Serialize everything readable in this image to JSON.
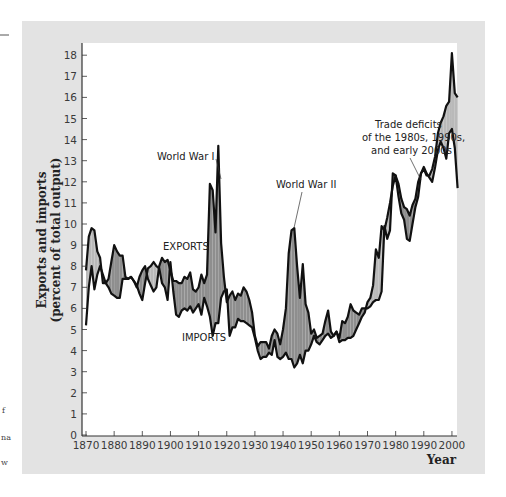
{
  "chart_data": {
    "type": "line",
    "title": "",
    "xlabel": "Year",
    "ylabel": "Exports and imports (percent of total output)",
    "ylabel_lines": [
      "Exports and imports",
      "(percent of total output)"
    ],
    "xlim": [
      1870,
      2002
    ],
    "ylim": [
      0,
      18.5
    ],
    "x_ticks": [
      1870,
      1880,
      1890,
      1900,
      1910,
      1920,
      1930,
      1940,
      1950,
      1960,
      1970,
      1980,
      1990,
      2000
    ],
    "y_ticks": [
      0,
      1,
      2,
      3,
      4,
      5,
      6,
      7,
      8,
      9,
      10,
      11,
      12,
      13,
      14,
      15,
      16,
      17,
      18
    ],
    "grid": false,
    "legend": "none (direct labels)",
    "fill_colors": {
      "exports_above": "#8e8e8e",
      "imports_above": "#b9b9b9"
    },
    "series": [
      {
        "name": "EXPORTS",
        "x": [
          1870,
          1871,
          1872,
          1873,
          1874,
          1875,
          1876,
          1877,
          1878,
          1879,
          1880,
          1881,
          1882,
          1883,
          1884,
          1885,
          1886,
          1887,
          1888,
          1889,
          1890,
          1891,
          1892,
          1893,
          1894,
          1895,
          1896,
          1897,
          1898,
          1899,
          1900,
          1901,
          1902,
          1903,
          1904,
          1905,
          1906,
          1907,
          1908,
          1909,
          1910,
          1911,
          1912,
          1913,
          1914,
          1915,
          1916,
          1917,
          1918,
          1919,
          1920,
          1921,
          1922,
          1923,
          1924,
          1925,
          1926,
          1927,
          1928,
          1929,
          1930,
          1931,
          1932,
          1933,
          1934,
          1935,
          1936,
          1937,
          1938,
          1939,
          1940,
          1941,
          1942,
          1943,
          1944,
          1945,
          1946,
          1947,
          1948,
          1949,
          1950,
          1951,
          1952,
          1953,
          1954,
          1955,
          1956,
          1957,
          1958,
          1959,
          1960,
          1961,
          1962,
          1963,
          1964,
          1965,
          1966,
          1967,
          1968,
          1969,
          1970,
          1971,
          1972,
          1973,
          1974,
          1975,
          1976,
          1977,
          1978,
          1979,
          1980,
          1981,
          1982,
          1983,
          1984,
          1985,
          1986,
          1987,
          1988,
          1989,
          1990,
          1991,
          1992,
          1993,
          1994,
          1995,
          1996,
          1997,
          1998,
          1999,
          2000,
          2001,
          2002
        ],
        "values": [
          5.2,
          7.0,
          8.0,
          6.9,
          7.6,
          8.0,
          7.6,
          7.2,
          7.4,
          8.2,
          9.0,
          8.7,
          8.5,
          8.5,
          7.5,
          7.4,
          7.5,
          7.3,
          7.0,
          7.5,
          7.8,
          8.0,
          7.4,
          7.1,
          6.8,
          7.0,
          8.0,
          8.4,
          8.2,
          8.3,
          7.8,
          7.3,
          7.3,
          7.2,
          7.2,
          7.5,
          7.4,
          7.7,
          6.9,
          6.8,
          7.0,
          7.6,
          7.2,
          7.6,
          11.9,
          11.6,
          9.6,
          13.7,
          9.1,
          7.5,
          6.3,
          6.6,
          6.8,
          6.4,
          6.7,
          6.6,
          7.0,
          6.8,
          6.4,
          5.8,
          4.7,
          4.2,
          4.4,
          4.4,
          4.4,
          4.1,
          4.7,
          5.0,
          4.8,
          4.3,
          5.0,
          6.0,
          8.6,
          9.7,
          9.8,
          8.0,
          6.5,
          8.1,
          6.2,
          5.8,
          4.8,
          5.0,
          4.6,
          4.7,
          4.8,
          5.4,
          5.9,
          4.9,
          4.7,
          4.9,
          4.6,
          5.4,
          5.3,
          5.6,
          6.2,
          5.9,
          5.8,
          5.7,
          6.0,
          6.0,
          6.0,
          6.1,
          6.3,
          6.4,
          6.4,
          6.8,
          9.9,
          9.3,
          9.7,
          12.4,
          12.3,
          11.9,
          11.2,
          10.8,
          10.7,
          10.4,
          10.9,
          11.2,
          12.0,
          12.4,
          12.7,
          12.4,
          12.2,
          12.0,
          12.7,
          13.5,
          13.9,
          13.6,
          13.1,
          14.3,
          14.5,
          13.6,
          11.7
        ]
      },
      {
        "name": "IMPORTS",
        "x": [
          1870,
          1871,
          1872,
          1873,
          1874,
          1875,
          1876,
          1877,
          1878,
          1879,
          1880,
          1881,
          1882,
          1883,
          1884,
          1885,
          1886,
          1887,
          1888,
          1889,
          1890,
          1891,
          1892,
          1893,
          1894,
          1895,
          1896,
          1897,
          1898,
          1899,
          1900,
          1901,
          1902,
          1903,
          1904,
          1905,
          1906,
          1907,
          1908,
          1909,
          1910,
          1911,
          1912,
          1913,
          1914,
          1915,
          1916,
          1917,
          1918,
          1919,
          1920,
          1921,
          1922,
          1923,
          1924,
          1925,
          1926,
          1927,
          1928,
          1929,
          1930,
          1931,
          1932,
          1933,
          1934,
          1935,
          1936,
          1937,
          1938,
          1939,
          1940,
          1941,
          1942,
          1943,
          1944,
          1945,
          1946,
          1947,
          1948,
          1949,
          1950,
          1951,
          1952,
          1953,
          1954,
          1955,
          1956,
          1957,
          1958,
          1959,
          1960,
          1961,
          1962,
          1963,
          1964,
          1965,
          1966,
          1967,
          1968,
          1969,
          1970,
          1971,
          1972,
          1973,
          1974,
          1975,
          1976,
          1977,
          1978,
          1979,
          1980,
          1981,
          1982,
          1983,
          1984,
          1985,
          1986,
          1987,
          1988,
          1989,
          1990,
          1991,
          1992,
          1993,
          1994,
          1995,
          1996,
          1997,
          1998,
          1999,
          2000,
          2001,
          2002
        ],
        "values": [
          7.8,
          9.4,
          9.8,
          9.7,
          8.7,
          8.4,
          7.2,
          7.2,
          7.0,
          6.7,
          6.6,
          6.5,
          6.5,
          7.4,
          7.4,
          7.4,
          7.5,
          7.3,
          7.1,
          6.7,
          6.4,
          7.2,
          7.9,
          8.0,
          8.2,
          8.0,
          7.9,
          7.2,
          7.0,
          6.4,
          8.2,
          6.8,
          5.7,
          5.6,
          5.9,
          6.0,
          5.9,
          6.1,
          5.8,
          6.0,
          6.2,
          5.7,
          6.5,
          6.1,
          5.6,
          4.7,
          5.3,
          5.3,
          6.5,
          6.8,
          6.9,
          4.7,
          5.1,
          5.1,
          5.5,
          5.4,
          5.4,
          5.3,
          5.2,
          5.1,
          4.6,
          4.0,
          3.6,
          3.7,
          3.7,
          3.9,
          3.8,
          4.5,
          3.7,
          3.6,
          3.7,
          3.9,
          3.6,
          3.6,
          3.2,
          3.4,
          3.8,
          3.4,
          4.0,
          4.0,
          4.3,
          4.7,
          4.4,
          4.3,
          4.5,
          4.7,
          4.8,
          4.6,
          4.7,
          4.9,
          4.4,
          4.5,
          4.5,
          4.6,
          4.6,
          4.7,
          5.0,
          5.3,
          5.6,
          5.8,
          6.3,
          6.5,
          7.1,
          8.8,
          8.4,
          9.9,
          9.7,
          10.3,
          11.0,
          11.8,
          12.3,
          11.3,
          10.5,
          10.2,
          9.3,
          9.2,
          10.0,
          10.8,
          11.3,
          12.4,
          12.6,
          12.3,
          12.3,
          12.6,
          13.2,
          14.3,
          14.8,
          15.1,
          15.6,
          15.8,
          18.1,
          16.2,
          16.0
        ]
      }
    ],
    "annotations": [
      {
        "text": "World War I",
        "x": 1916,
        "y": 12.0
      },
      {
        "text": "World War II",
        "x": 1943,
        "y": 9.8
      },
      {
        "text": "EXPORTS",
        "x": 1910,
        "y": 8.3
      },
      {
        "text": "IMPORTS",
        "x": 1918,
        "y": 4.7
      },
      {
        "text": "Trade deficits of the 1980s, 1990s, and early 2000s",
        "x": 1988,
        "y": 12.3
      }
    ]
  },
  "labels": {
    "ylabel_line1": "Exports and imports",
    "ylabel_line2": "(percent of total output)",
    "xlabel": "Year",
    "ww1": "World War I",
    "ww2": "World War II",
    "exports": "EXPORTS",
    "imports": "IMPORTS",
    "deficit_line1": "Trade deficits",
    "deficit_line2": "of the 1980s, 1990s,",
    "deficit_line3": "and early 2000s"
  },
  "margin_fragments": [
    "f",
    "na",
    "w"
  ]
}
